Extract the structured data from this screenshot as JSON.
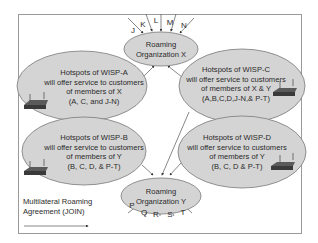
{
  "diagram": {
    "nodes": {
      "org_x": {
        "line1": "Roaming",
        "line2": "Organization X"
      },
      "org_y": {
        "line1": "Roaming",
        "line2": "Organization Y"
      },
      "wisp_a": {
        "line1": "Hotspots of WISP-A",
        "line2": "will offer service to customers",
        "line3": "of members of X",
        "line4": "(A, C, and J-N)"
      },
      "wisp_b": {
        "line1": "Hotspots of WISP-B",
        "line2": "will offer service to customers",
        "line3": "of members of Y",
        "line4": "(B, C, D, & P-T)"
      },
      "wisp_c": {
        "line1": "Hotspots of WISP-C",
        "line2": "will offer service to customers",
        "line3": "of members of X & Y",
        "line4": "(A,B,C,D,J-N,& P-T)"
      },
      "wisp_d": {
        "line1": "Hotspots of WISP-D",
        "line2": "will offer service to customers",
        "line3": "of members of Y",
        "line4": "(B, C, D & P-T)"
      }
    },
    "members_x": [
      "J",
      "K",
      "L",
      "M",
      "N"
    ],
    "members_y": [
      "P",
      "Q",
      "R",
      "S",
      "T"
    ],
    "edges": [
      {
        "from": "wisp_a",
        "to": "org_x"
      },
      {
        "from": "wisp_c",
        "to": "org_x"
      },
      {
        "from": "wisp_c",
        "to": "org_y"
      },
      {
        "from": "wisp_b",
        "to": "org_y"
      },
      {
        "from": "wisp_d",
        "to": "org_y"
      }
    ],
    "legend": {
      "line1": "Multilateral Roaming",
      "line2": "Agreement (JOIN)"
    },
    "colors": {
      "ellipse_fill": "#d4d4d4",
      "ellipse_stroke": "#7a7a7a",
      "line": "#555555",
      "frame": "#9a9a9a",
      "router": "#4a4a4a"
    }
  }
}
